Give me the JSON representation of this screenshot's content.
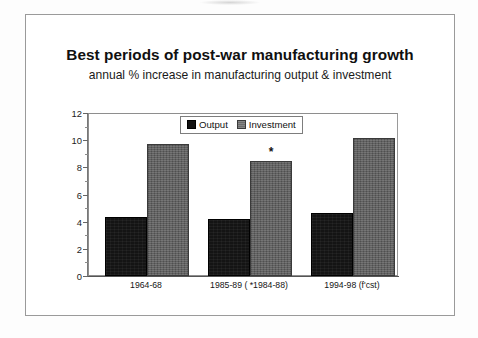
{
  "chart_data": {
    "type": "bar",
    "title": "Best periods of post-war manufacturing growth",
    "subtitle": "annual % increase in manufacturing output & investment",
    "xlabel": "",
    "ylabel": "",
    "ylim": [
      0,
      12
    ],
    "yticks": [
      12,
      10,
      8,
      6,
      4,
      2,
      0
    ],
    "grid": false,
    "legend_position": "top-center-inside",
    "categories": [
      "1964-68",
      "1985-89 ( *1984-88)",
      "1994-98 (f'cst)"
    ],
    "series": [
      {
        "name": "Output",
        "color": "#141414",
        "values": [
          4.4,
          4.2,
          4.7
        ]
      },
      {
        "name": "Investment",
        "color": "#5c5c5c",
        "values": [
          9.8,
          8.5,
          10.2
        ]
      }
    ],
    "annotations": [
      {
        "text": "*",
        "category": "1985-89 ( *1984-88)",
        "series": "Investment",
        "value": 8.5
      }
    ]
  },
  "legend": {
    "items": [
      {
        "label": "Output",
        "swatch": "output-swatch"
      },
      {
        "label": "Investment",
        "swatch": "investment-swatch"
      }
    ]
  },
  "axis": {
    "y_labels": [
      "12",
      "10",
      "8",
      "6",
      "4",
      "2",
      "0"
    ],
    "x_labels": [
      "1964-68",
      "1985-89 ( *1984-88)",
      "1994-98 (f'cst)"
    ]
  },
  "annotation": {
    "star": "*"
  }
}
